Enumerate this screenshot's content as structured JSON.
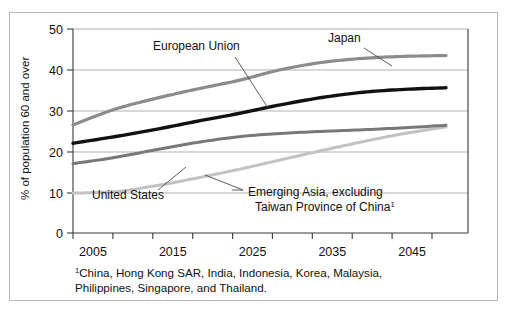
{
  "figure": {
    "ylabel": "% of population 60 and over",
    "footnote_line1": "China, Hong Kong SAR, India, Indonesia, Korea, Malaysia,",
    "footnote_line2": "Philippines, Singapore, and Thailand.",
    "footnote_marker": "1"
  },
  "chart_data": {
    "type": "line",
    "title": "",
    "xlabel": "",
    "ylabel": "% of population 60 and over",
    "xlim": [
      2005,
      2050
    ],
    "ylim": [
      0,
      50
    ],
    "yticks": [
      0,
      10,
      20,
      30,
      40,
      50
    ],
    "xticks": [
      2005,
      2010,
      2015,
      2020,
      2025,
      2030,
      2035,
      2040,
      2045,
      2050
    ],
    "xtick_labels": [
      "2005",
      "",
      "2015",
      "",
      "2025",
      "",
      "2035",
      "",
      "2045",
      ""
    ],
    "grid": "horizontal",
    "legend": "annotations",
    "x": [
      2005,
      2010,
      2015,
      2020,
      2025,
      2030,
      2035,
      2040,
      2045,
      2050
    ],
    "series": [
      {
        "name": "Japan",
        "color": "#8c8c8c",
        "width": 3.2,
        "values": [
          26.5,
          30.3,
          33.0,
          35.3,
          37.4,
          40.0,
          41.8,
          42.8,
          43.3,
          43.5
        ]
      },
      {
        "name": "European Union",
        "color": "#111111",
        "width": 3.4,
        "values": [
          22.0,
          23.6,
          25.4,
          27.4,
          29.3,
          31.4,
          33.2,
          34.5,
          35.2,
          35.6
        ]
      },
      {
        "name": "United States",
        "color": "#787878",
        "width": 3.0,
        "values": [
          17.0,
          18.5,
          20.4,
          22.2,
          23.6,
          24.4,
          24.9,
          25.3,
          25.8,
          26.4
        ]
      },
      {
        "name": "Emerging Asia, excluding Taiwan Province of China",
        "color": "#c2c2c2",
        "width": 3.0,
        "values": [
          9.8,
          10.1,
          11.6,
          13.5,
          15.6,
          17.9,
          20.2,
          22.4,
          24.4,
          26.0
        ]
      }
    ],
    "annotations": [
      {
        "id": "european-union",
        "text": "European Union",
        "x": 153,
        "y": 50
      },
      {
        "id": "japan",
        "text": "Japan",
        "x": 328,
        "y": 42
      },
      {
        "id": "united-states",
        "text": "United States",
        "x": 92,
        "y": 199
      },
      {
        "id": "emerging-asia-line1",
        "text": "Emerging Asia, excluding",
        "x": 245,
        "y": 196
      },
      {
        "id": "emerging-asia-line2",
        "text": "Taiwan Province of China",
        "x": 254,
        "y": 211
      }
    ]
  }
}
